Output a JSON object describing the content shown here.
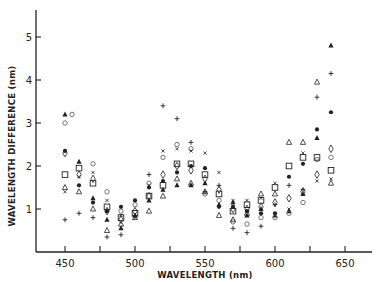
{
  "chart_data": {
    "type": "scatter",
    "title": "",
    "xlabel": "WAVELENGTH (nm)",
    "ylabel": "WAVELENGTH DIFFERENCE (nm)",
    "xlim": [
      430,
      665
    ],
    "ylim": [
      0,
      5.6
    ],
    "x_ticks": [
      450,
      500,
      550,
      600,
      650
    ],
    "x_minor_ticks": [
      475,
      525,
      575,
      625
    ],
    "y_ticks": [
      1,
      2,
      3,
      4,
      5
    ],
    "grid": false,
    "legend": null,
    "series": [
      {
        "name": "filled-triangle",
        "marker": "triangle-filled",
        "points": [
          [
            450,
            3.2
          ],
          [
            460,
            2.1
          ],
          [
            470,
            1.25
          ],
          [
            480,
            0.75
          ],
          [
            490,
            0.55
          ],
          [
            500,
            0.85
          ],
          [
            510,
            1.2
          ],
          [
            520,
            1.45
          ],
          [
            530,
            1.55
          ],
          [
            540,
            1.55
          ],
          [
            550,
            1.6
          ],
          [
            560,
            1.1
          ],
          [
            570,
            1.15
          ],
          [
            580,
            0.85
          ],
          [
            590,
            1.0
          ],
          [
            600,
            0.85
          ],
          [
            610,
            0.95
          ],
          [
            620,
            1.35
          ],
          [
            630,
            2.65
          ],
          [
            640,
            4.8
          ]
        ]
      },
      {
        "name": "open-circle",
        "marker": "circle-open",
        "points": [
          [
            450,
            3.0
          ],
          [
            455,
            3.2
          ],
          [
            470,
            2.05
          ],
          [
            480,
            1.4
          ],
          [
            490,
            0.95
          ],
          [
            500,
            1.1
          ],
          [
            510,
            1.6
          ],
          [
            520,
            2.2
          ],
          [
            530,
            2.5
          ],
          [
            540,
            2.4
          ],
          [
            550,
            1.35
          ],
          [
            560,
            1.2
          ],
          [
            570,
            0.7
          ],
          [
            580,
            0.65
          ],
          [
            590,
            0.8
          ],
          [
            600,
            0.8
          ],
          [
            610,
            0.9
          ],
          [
            620,
            1.15
          ],
          [
            630,
            2.15
          ],
          [
            640,
            2.2
          ]
        ]
      },
      {
        "name": "open-square",
        "marker": "square-open",
        "points": [
          [
            450,
            1.8
          ],
          [
            460,
            1.95
          ],
          [
            470,
            1.6
          ],
          [
            480,
            1.05
          ],
          [
            490,
            0.8
          ],
          [
            500,
            0.9
          ],
          [
            510,
            1.3
          ],
          [
            520,
            1.55
          ],
          [
            530,
            2.05
          ],
          [
            540,
            2.05
          ],
          [
            550,
            1.8
          ],
          [
            560,
            1.35
          ],
          [
            570,
            0.95
          ],
          [
            580,
            1.1
          ],
          [
            590,
            1.2
          ],
          [
            600,
            1.5
          ],
          [
            610,
            2.0
          ],
          [
            620,
            2.2
          ],
          [
            630,
            2.2
          ],
          [
            640,
            1.9
          ]
        ]
      },
      {
        "name": "filled-circle",
        "marker": "circle-filled",
        "points": [
          [
            450,
            2.35
          ],
          [
            460,
            1.55
          ],
          [
            470,
            1.15
          ],
          [
            480,
            0.95
          ],
          [
            490,
            1.05
          ],
          [
            500,
            1.2
          ],
          [
            510,
            1.5
          ],
          [
            520,
            1.65
          ],
          [
            530,
            1.85
          ],
          [
            540,
            2.0
          ],
          [
            550,
            1.95
          ],
          [
            560,
            1.05
          ],
          [
            570,
            1.05
          ],
          [
            580,
            0.95
          ],
          [
            590,
            0.9
          ],
          [
            600,
            0.9
          ],
          [
            610,
            1.75
          ],
          [
            620,
            2.05
          ],
          [
            630,
            2.85
          ],
          [
            640,
            3.25
          ]
        ]
      },
      {
        "name": "open-diamond",
        "marker": "diamond-open",
        "points": [
          [
            450,
            2.3
          ],
          [
            460,
            1.8
          ],
          [
            470,
            1.7
          ],
          [
            480,
            0.95
          ],
          [
            490,
            0.75
          ],
          [
            500,
            0.95
          ],
          [
            510,
            1.3
          ],
          [
            520,
            1.8
          ],
          [
            530,
            2.0
          ],
          [
            540,
            1.9
          ],
          [
            550,
            1.7
          ],
          [
            560,
            1.45
          ],
          [
            570,
            1.0
          ],
          [
            580,
            1.0
          ],
          [
            590,
            1.05
          ],
          [
            600,
            1.15
          ],
          [
            610,
            1.25
          ],
          [
            620,
            1.4
          ],
          [
            630,
            1.8
          ],
          [
            640,
            2.4
          ]
        ]
      },
      {
        "name": "open-triangle",
        "marker": "triangle-open",
        "points": [
          [
            450,
            1.5
          ],
          [
            460,
            1.4
          ],
          [
            470,
            1.0
          ],
          [
            480,
            0.5
          ],
          [
            490,
            0.65
          ],
          [
            500,
            0.8
          ],
          [
            510,
            0.95
          ],
          [
            520,
            1.3
          ],
          [
            530,
            1.7
          ],
          [
            540,
            1.6
          ],
          [
            550,
            1.4
          ],
          [
            560,
            0.85
          ],
          [
            570,
            0.75
          ],
          [
            580,
            0.9
          ],
          [
            590,
            1.35
          ],
          [
            600,
            1.35
          ],
          [
            610,
            2.55
          ],
          [
            620,
            2.55
          ],
          [
            630,
            3.95
          ],
          [
            640,
            1.6
          ]
        ]
      },
      {
        "name": "x-mark",
        "marker": "x",
        "points": [
          [
            450,
            1.4
          ],
          [
            460,
            1.75
          ],
          [
            470,
            1.85
          ],
          [
            480,
            1.2
          ],
          [
            490,
            0.85
          ],
          [
            500,
            0.8
          ],
          [
            510,
            1.55
          ],
          [
            520,
            2.35
          ],
          [
            530,
            2.4
          ],
          [
            540,
            2.35
          ],
          [
            550,
            2.3
          ],
          [
            560,
            1.85
          ],
          [
            570,
            1.2
          ],
          [
            580,
            1.2
          ],
          [
            590,
            1.25
          ],
          [
            600,
            1.6
          ],
          [
            610,
            1.0
          ],
          [
            620,
            2.3
          ],
          [
            630,
            1.65
          ],
          [
            640,
            1.7
          ]
        ]
      },
      {
        "name": "plus",
        "marker": "plus",
        "points": [
          [
            450,
            0.75
          ],
          [
            460,
            0.9
          ],
          [
            470,
            0.8
          ],
          [
            480,
            0.35
          ],
          [
            490,
            0.4
          ],
          [
            500,
            0.85
          ],
          [
            510,
            1.8
          ],
          [
            520,
            3.4
          ],
          [
            530,
            3.1
          ],
          [
            540,
            2.55
          ],
          [
            550,
            1.4
          ],
          [
            560,
            1.55
          ],
          [
            570,
            0.55
          ],
          [
            580,
            0.45
          ],
          [
            590,
            0.6
          ],
          [
            600,
            1.1
          ],
          [
            610,
            1.55
          ],
          [
            620,
            1.45
          ],
          [
            630,
            3.6
          ],
          [
            640,
            4.15
          ]
        ]
      }
    ]
  }
}
